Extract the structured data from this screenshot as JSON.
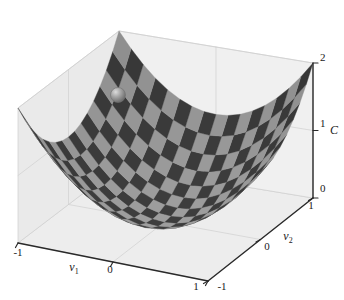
{
  "figure": {
    "kind": "3d-surface-plot",
    "background_color": "#ffffff",
    "wall_color": "#f0f0f0",
    "wall_color_left": "#eaeaea",
    "floor_color": "#ededed",
    "grid_color": "#d0d0d0",
    "axis_color": "#2a2a2a",
    "surface_dark": "#3d3d3d",
    "surface_light": "#9e9e9e",
    "marker_color": "#9a9a9a",
    "marker_highlight": "#d8d8d8",
    "marker_shadow": "#6a6a6a"
  },
  "axes": {
    "x": {
      "title": "v",
      "subscript": "1",
      "ticks": [
        "-1",
        "0",
        "1"
      ],
      "range": [
        -1,
        1
      ]
    },
    "y": {
      "title": "v",
      "subscript": "2",
      "ticks": [
        "-1",
        "0",
        "1"
      ],
      "range": [
        -1,
        1
      ]
    },
    "z": {
      "title": "C",
      "subscript": "",
      "ticks": [
        "0",
        "1",
        "2"
      ],
      "range": [
        0,
        2
      ]
    }
  },
  "marker": {
    "name": "ball-marker",
    "x": 118,
    "y": 95,
    "radius": 7.5
  },
  "chart_data": {
    "type": "surface",
    "title": "",
    "xlabel": "v1",
    "ylabel": "v2",
    "zlabel": "C",
    "xlim": [
      -1,
      1
    ],
    "ylim": [
      -1,
      1
    ],
    "zlim": [
      0,
      2
    ],
    "xticks": [
      -1,
      0,
      1
    ],
    "yticks": [
      -1,
      0,
      1
    ],
    "zticks": [
      0,
      1,
      2
    ],
    "function": "C = v1^2 + v2^2",
    "grid": true,
    "legend": "none",
    "texture": "checkerboard",
    "checker_divisions": 16,
    "annotations": [
      {
        "label": "ball",
        "v1": -0.45,
        "v2": -0.35,
        "C": 0.32
      }
    ],
    "samples": {
      "v1": [
        -1,
        -0.75,
        -0.5,
        -0.25,
        0,
        0.25,
        0.5,
        0.75,
        1
      ],
      "v2": [
        -1,
        -0.75,
        -0.5,
        -0.25,
        0,
        0.25,
        0.5,
        0.75,
        1
      ],
      "C": [
        [
          2.0,
          1.5625,
          1.25,
          1.0625,
          1.0,
          1.0625,
          1.25,
          1.5625,
          2.0
        ],
        [
          1.5625,
          1.125,
          0.8125,
          0.625,
          0.5625,
          0.625,
          0.8125,
          1.125,
          1.5625
        ],
        [
          1.25,
          0.8125,
          0.5,
          0.3125,
          0.25,
          0.3125,
          0.5,
          0.8125,
          1.25
        ],
        [
          1.0625,
          0.625,
          0.3125,
          0.125,
          0.0625,
          0.125,
          0.3125,
          0.625,
          1.0625
        ],
        [
          1.0,
          0.5625,
          0.25,
          0.0625,
          0.0,
          0.0625,
          0.25,
          0.5625,
          1.0
        ],
        [
          1.0625,
          0.625,
          0.3125,
          0.125,
          0.0625,
          0.125,
          0.3125,
          0.625,
          1.0625
        ],
        [
          1.25,
          0.8125,
          0.5,
          0.3125,
          0.25,
          0.3125,
          0.5,
          0.8125,
          1.25
        ],
        [
          1.5625,
          1.125,
          0.8125,
          0.625,
          0.5625,
          0.625,
          0.8125,
          1.125,
          1.5625
        ],
        [
          2.0,
          1.5625,
          1.25,
          1.0625,
          1.0,
          1.0625,
          1.25,
          1.5625,
          2.0
        ]
      ]
    }
  },
  "labels": {
    "x_tick_neg1": "-1",
    "x_tick_0": "0",
    "x_tick_1": "1",
    "y_tick_neg1": "-1",
    "y_tick_0": "0",
    "y_tick_1": "1",
    "z_tick_0": "0",
    "z_tick_1": "1",
    "z_tick_2": "2",
    "x_axis_title": "v",
    "x_axis_sub": "1",
    "y_axis_title": "v",
    "y_axis_sub": "2",
    "z_axis_title": "C"
  }
}
